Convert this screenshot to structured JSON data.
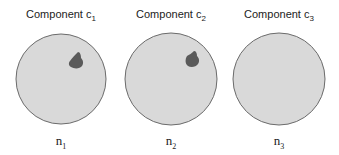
{
  "diagram": {
    "components": [
      {
        "title_prefix": "Component c",
        "title_sub": "1",
        "node_prefix": "n",
        "node_sub": "1",
        "has_blob": true
      },
      {
        "title_prefix": "Component c",
        "title_sub": "2",
        "node_prefix": "n",
        "node_sub": "2",
        "has_blob": true
      },
      {
        "title_prefix": "Component c",
        "title_sub": "3",
        "node_prefix": "n",
        "node_sub": "3",
        "has_blob": false
      }
    ],
    "colors": {
      "circle_fill": "#d9d9d9",
      "circle_stroke": "#6b6b6b",
      "blob_fill": "#5a5a5a"
    }
  }
}
